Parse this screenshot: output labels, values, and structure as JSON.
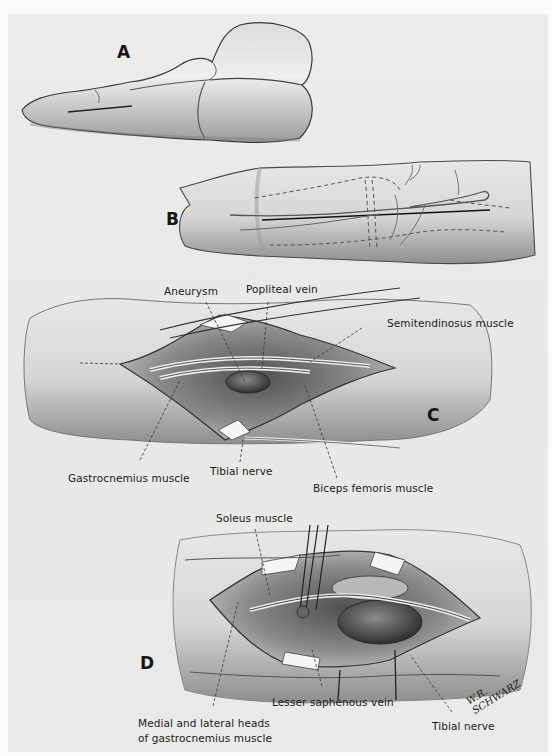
{
  "figure": {
    "panels": [
      {
        "letter": "A",
        "description": "Leg in prone position with skin incision line over the popliteal region"
      },
      {
        "letter": "B",
        "description": "Posterior knee with planned incision and dashed outlines of underlying vessels and nerves"
      },
      {
        "letter": "C",
        "description": "Popliteal fossa exposed showing aneurysm between retracted muscles"
      },
      {
        "letter": "D",
        "description": "Deeper dissection with forceps retracting vessels, exposing aneurysm"
      }
    ],
    "panel_c_labels": {
      "aneurysm": "Aneurysm",
      "popliteal_vein": "Popliteal vein",
      "semitendinosus": "Semitendinosus muscle",
      "gastrocnemius": "Gastrocnemius muscle",
      "tibial_nerve": "Tibial nerve",
      "biceps_femoris": "Biceps femoris muscle"
    },
    "panel_d_labels": {
      "soleus": "Soleus muscle",
      "medial_lateral_heads_line1": "Medial and lateral heads",
      "medial_lateral_heads_line2": "of gastrocnemius muscle",
      "lesser_saphenous": "Lesser saphenous vein",
      "tibial_nerve": "Tibial nerve"
    },
    "signature": "W.R. SCHWARZ"
  }
}
